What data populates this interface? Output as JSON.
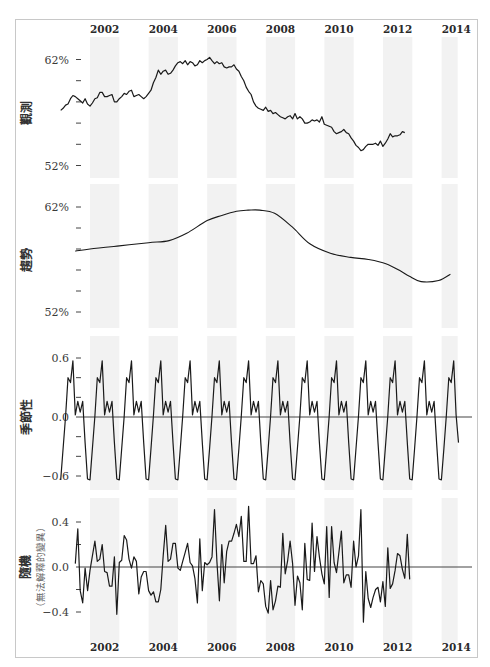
{
  "chart_data": {
    "type": "line",
    "title": "",
    "x_axis": {
      "tick_labels": [
        "2002",
        "2004",
        "2006",
        "2008",
        "2010",
        "2012",
        "2014"
      ],
      "range": [
        2001.0,
        2014.55
      ],
      "shaded_bands": [
        [
          2002,
          2003
        ],
        [
          2004,
          2005
        ],
        [
          2006,
          2007
        ],
        [
          2008,
          2009
        ],
        [
          2010,
          2011
        ],
        [
          2012,
          2013
        ],
        [
          2014,
          2014.55
        ]
      ],
      "shown_top": true,
      "shown_bottom": true
    },
    "panels": [
      {
        "name": "observed",
        "ylabel": "觀測",
        "ylim": [
          52,
          62
        ],
        "y_ticks": [
          62,
          60,
          58,
          56,
          54,
          52
        ],
        "y_tick_labels": [
          "62%",
          "",
          "",
          "",
          "",
          "52%"
        ],
        "series": {
          "x_start": 2001.0,
          "step": 0.0833,
          "values": [
            57.2,
            57.4,
            57.7,
            57.8,
            58.3,
            58.6,
            58.5,
            58.3,
            58.1,
            57.9,
            58.3,
            57.8,
            57.6,
            57.9,
            58.3,
            58.4,
            58.9,
            58.9,
            58.5,
            58.5,
            58.6,
            58.7,
            58.0,
            58.0,
            58.3,
            58.5,
            58.8,
            58.7,
            59.0,
            59.1,
            58.5,
            58.6,
            58.7,
            58.5,
            58.3,
            58.5,
            58.8,
            59.1,
            59.8,
            60.3,
            61.0,
            60.6,
            60.9,
            61.0,
            60.6,
            60.7,
            61.0,
            61.4,
            61.7,
            61.8,
            61.6,
            61.9,
            61.5,
            61.8,
            61.7,
            61.4,
            61.5,
            61.9,
            61.7,
            61.9,
            62.0,
            62.2,
            61.9,
            61.6,
            61.8,
            61.6,
            61.7,
            61.3,
            61.2,
            61.3,
            61.3,
            61.5,
            61.1,
            60.9,
            60.4,
            60.0,
            59.4,
            59.0,
            58.7,
            58.0,
            57.6,
            57.4,
            57.3,
            57.2,
            57.5,
            57.1,
            57.2,
            56.9,
            57.0,
            56.8,
            56.6,
            56.5,
            56.4,
            56.6,
            56.7,
            56.4,
            56.9,
            56.4,
            56.6,
            56.4,
            56.0,
            56.0,
            56.1,
            56.3,
            56.2,
            56.3,
            56.1,
            56.6,
            55.9,
            55.8,
            55.7,
            55.6,
            55.2,
            55.0,
            55.1,
            55.2,
            55.4,
            55.1,
            55.0,
            54.6,
            54.3,
            53.9,
            53.7,
            53.4,
            53.5,
            53.8,
            54.0,
            54.0,
            54.0,
            54.1,
            53.9,
            54.3,
            53.8,
            54.1,
            54.5,
            55.0,
            54.7,
            54.8,
            54.8,
            54.9,
            55.2,
            55.1
          ]
        }
      },
      {
        "name": "trend",
        "ylabel": "趨勢",
        "ylim": [
          52,
          62
        ],
        "y_ticks": [
          62,
          60,
          58,
          56,
          54,
          52
        ],
        "y_tick_labels": [
          "62%",
          "",
          "",
          "",
          "",
          "52%"
        ],
        "series": {
          "x": [
            2001.5,
            2002.0,
            2003.0,
            2004.0,
            2004.7,
            2005.3,
            2006.0,
            2006.5,
            2007.0,
            2007.4,
            2007.8,
            2008.3,
            2008.9,
            2009.5,
            2010.2,
            2010.9,
            2011.5,
            2012.1,
            2012.6,
            2012.9,
            2013.3,
            2013.9,
            2014.3
          ],
          "values": [
            57.8,
            58.0,
            58.3,
            58.6,
            58.8,
            59.5,
            60.7,
            61.2,
            61.6,
            61.7,
            61.7,
            61.4,
            60.1,
            58.5,
            57.6,
            57.2,
            57.0,
            56.6,
            55.9,
            55.4,
            54.9,
            55.0,
            55.6
          ]
        }
      },
      {
        "name": "seasonal",
        "ylabel": "季節性",
        "ylim": [
          -0.6,
          0.6
        ],
        "y_ticks": [
          0.6,
          0.4,
          0.2,
          0.0,
          -0.2,
          -0.4,
          -0.6
        ],
        "y_tick_labels": [
          "0.6",
          "",
          "",
          "0.0",
          "",
          "",
          "-0.6"
        ],
        "series": {
          "x_start": 2001.0,
          "step": 0.0833,
          "period": 12,
          "one_cycle": [
            -0.64,
            -0.32,
            0.01,
            0.4,
            0.35,
            0.57,
            0.02,
            0.16,
            0.05,
            0.16,
            -0.26,
            -0.63
          ]
        }
      },
      {
        "name": "random",
        "ylabel": "隨機",
        "ylabel_sub": "（無法解釋的變異）",
        "ylim": [
          -0.45,
          0.55
        ],
        "y_ticks": [
          0.4,
          0.2,
          0.0,
          -0.2,
          -0.4
        ],
        "y_tick_labels": [
          "0.4",
          "",
          "0.0",
          "",
          "-0.4"
        ],
        "series": {
          "x_start": 2001.5,
          "step": 0.0833,
          "values": [
            0.03,
            0.34,
            -0.21,
            -0.32,
            -0.01,
            -0.21,
            -0.03,
            0.1,
            0.23,
            0.05,
            0.07,
            0.2,
            -0.04,
            -0.05,
            -0.17,
            -0.17,
            0.09,
            -0.42,
            0.04,
            0.06,
            0.28,
            0.24,
            0.07,
            -0.01,
            0.09,
            0.05,
            -0.24,
            -0.09,
            -0.04,
            -0.04,
            -0.21,
            -0.25,
            -0.22,
            -0.31,
            -0.31,
            -0.2,
            0.1,
            0.37,
            0.05,
            0.07,
            0.21,
            0.21,
            -0.01,
            -0.03,
            0.05,
            0.13,
            0.21,
            0.04,
            0.01,
            -0.1,
            -0.32,
            0.25,
            -0.21,
            0.04,
            0.02,
            0.04,
            0.09,
            0.51,
            0.05,
            -0.3,
            0.2,
            -0.14,
            0.14,
            0.23,
            0.23,
            0.3,
            0.38,
            0.27,
            0.45,
            0.05,
            0.05,
            0.54,
            0.03,
            0.03,
            0.1,
            -0.22,
            -0.12,
            -0.15,
            -0.35,
            -0.41,
            -0.12,
            -0.38,
            -0.3,
            -0.17,
            -0.18,
            0.3,
            -0.06,
            0.06,
            0.23,
            0.03,
            -0.34,
            -0.08,
            -0.14,
            -0.38,
            0.21,
            -0.11,
            -0.12,
            0.39,
            -0.04,
            0.27,
            0.09,
            -0.06,
            -0.15,
            0.36,
            -0.27,
            0.36,
            0.04,
            -0.05,
            0.13,
            0.32,
            -0.14,
            -0.07,
            -0.07,
            -0.18,
            0.23,
            0.0,
            0.1,
            0.51,
            -0.49,
            -0.04,
            -0.28,
            -0.36,
            -0.27,
            -0.2,
            -0.18,
            -0.31,
            -0.13,
            -0.35,
            0.17,
            -0.19,
            -0.15,
            -0.03,
            0.12,
            0.1,
            -0.02,
            -0.1,
            0.29,
            -0.11
          ]
        }
      }
    ],
    "colors": {
      "line": "#1a1a1a",
      "zero_line": "#444444",
      "band": "#f2f2f2",
      "frame": "#c8c8c8"
    }
  }
}
